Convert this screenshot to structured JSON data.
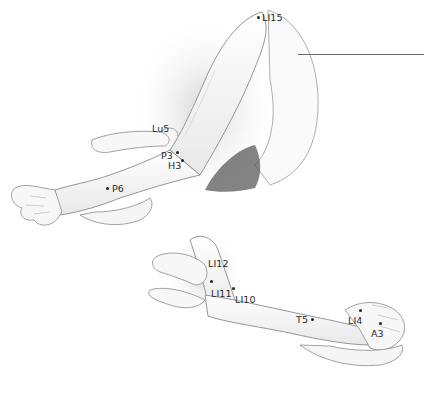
{
  "figure": {
    "colors": {
      "skin_fill": "#f4f4f4",
      "outline": "#8a8a8a",
      "shading": "#cfcfcf",
      "shadow": "#4a4a4a",
      "label": "#2a2a2a"
    }
  },
  "points": [
    {
      "id": "LI15",
      "label": "LI15",
      "x": 258,
      "y": 17,
      "lx": 262,
      "ly": 14
    },
    {
      "id": "Lu5",
      "label": "Lu5",
      "x": null,
      "y": null,
      "lx": 152,
      "ly": 124
    },
    {
      "id": "P3",
      "label": "P3",
      "x": 177,
      "y": 152,
      "lx": 161,
      "ly": 151
    },
    {
      "id": "H3",
      "label": "H3",
      "x": 182,
      "y": 161,
      "lx": 168,
      "ly": 161
    },
    {
      "id": "P6",
      "label": "P6",
      "x": 107,
      "y": 188,
      "lx": 112,
      "ly": 184
    },
    {
      "id": "LI12",
      "label": "LI12",
      "x": null,
      "y": null,
      "lx": 208,
      "ly": 259
    },
    {
      "id": "LI11",
      "label": "LI11",
      "x": 211,
      "y": 281,
      "lx": 211,
      "ly": 289
    },
    {
      "id": "LI10",
      "label": "LI10",
      "x": 233,
      "y": 288,
      "lx": 235,
      "ly": 295
    },
    {
      "id": "T5",
      "label": "T5",
      "x": 312,
      "y": 319,
      "lx": 296,
      "ly": 315
    },
    {
      "id": "LI4",
      "label": "LI4",
      "x": 360,
      "y": 310,
      "lx": 348,
      "ly": 316
    },
    {
      "id": "A3",
      "label": "A3",
      "x": 380,
      "y": 323,
      "lx": 371,
      "ly": 329
    }
  ]
}
